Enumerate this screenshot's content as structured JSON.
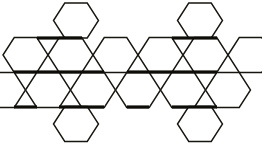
{
  "figure": {
    "background_color": "#ffffff",
    "stroke_color": "#17150f",
    "accent_stroke_color": "#0d0c08",
    "caption_fragment": "ons.",
    "width": 262,
    "height": 150
  },
  "chart_data": {
    "type": "diagram",
    "title": "",
    "subtitle": "",
    "xlabel": "",
    "ylabel": "",
    "grid": false,
    "legend": [],
    "annotations": [
      "ons."
    ],
    "geometry": {
      "hex_half_width": 22.5,
      "hex_point_inset": 11.25,
      "hex_half_height": 17.5,
      "column_pitch": 45,
      "row_pitch": 35,
      "thin_stroke_width": 1.4,
      "thick_stroke_width": 3.2
    },
    "rows": [
      {
        "index": 0,
        "center_y": 20.5,
        "centers_x": [
          76,
          200
        ],
        "count": 2
      },
      {
        "index": 1,
        "center_y": 55,
        "centers_x": [
          25.5,
          70.5,
          115.5,
          160.5,
          205.5,
          250.5
        ],
        "count": 6
      },
      {
        "index": 2,
        "center_y": 90,
        "centers_x": [
          3,
          48,
          93,
          138,
          183,
          228
        ],
        "count": 6
      },
      {
        "index": 3,
        "center_y": 124,
        "centers_x": [
          76,
          200
        ],
        "count": 2
      }
    ],
    "cells": [
      {
        "id": "r0c0",
        "cx": 76,
        "cy": 20.5,
        "row": 0,
        "col": 0
      },
      {
        "id": "r0c1",
        "cx": 200,
        "cy": 20.5,
        "row": 0,
        "col": 1
      },
      {
        "id": "r1c0",
        "cx": 25.5,
        "cy": 55,
        "row": 1,
        "col": 0
      },
      {
        "id": "r1c1",
        "cx": 70.5,
        "cy": 55,
        "row": 1,
        "col": 1
      },
      {
        "id": "r1c2",
        "cx": 115.5,
        "cy": 55,
        "row": 1,
        "col": 2
      },
      {
        "id": "r1c3",
        "cx": 160.5,
        "cy": 55,
        "row": 1,
        "col": 3
      },
      {
        "id": "r1c4",
        "cx": 205.5,
        "cy": 55,
        "row": 1,
        "col": 4
      },
      {
        "id": "r1c5",
        "cx": 250.5,
        "cy": 55,
        "row": 1,
        "col": 5
      },
      {
        "id": "r2c0",
        "cx": 3,
        "cy": 90,
        "row": 2,
        "col": 0
      },
      {
        "id": "r2c1",
        "cx": 48,
        "cy": 90,
        "row": 2,
        "col": 1
      },
      {
        "id": "r2c2",
        "cx": 93,
        "cy": 90,
        "row": 2,
        "col": 2
      },
      {
        "id": "r2c3",
        "cx": 138,
        "cy": 90,
        "row": 2,
        "col": 3
      },
      {
        "id": "r2c4",
        "cx": 183,
        "cy": 90,
        "row": 2,
        "col": 4
      },
      {
        "id": "r2c5",
        "cx": 228,
        "cy": 90,
        "row": 2,
        "col": 5
      },
      {
        "id": "r3c0",
        "cx": 76,
        "cy": 124,
        "row": 3,
        "col": 0
      },
      {
        "id": "r3c1",
        "cx": 200,
        "cy": 124,
        "row": 3,
        "col": 1
      }
    ],
    "thick_edges": [
      {
        "x1": 37,
        "y1": 38,
        "x2": 60,
        "y2": 38
      },
      {
        "x1": 60,
        "y1": 38,
        "x2": 82,
        "y2": 38
      },
      {
        "x1": 14,
        "y1": 72,
        "x2": 37,
        "y2": 72
      },
      {
        "x1": 37,
        "y1": 72,
        "x2": 59,
        "y2": 72
      },
      {
        "x1": 59,
        "y1": 72,
        "x2": 82,
        "y2": 72
      },
      {
        "x1": 82,
        "y1": 72,
        "x2": 104,
        "y2": 72
      },
      {
        "x1": 127,
        "y1": 72,
        "x2": 149,
        "y2": 72
      },
      {
        "x1": 149,
        "y1": 72,
        "x2": 172,
        "y2": 72
      },
      {
        "x1": 172,
        "y1": 72,
        "x2": 194,
        "y2": 72
      },
      {
        "x1": 194,
        "y1": 72,
        "x2": 217,
        "y2": 72
      },
      {
        "x1": 14,
        "y1": 107,
        "x2": 37,
        "y2": 107
      },
      {
        "x1": 59,
        "y1": 107,
        "x2": 82,
        "y2": 107
      },
      {
        "x1": 82,
        "y1": 107,
        "x2": 104,
        "y2": 107
      },
      {
        "x1": 127,
        "y1": 107,
        "x2": 149,
        "y2": 107
      },
      {
        "x1": 172,
        "y1": 107,
        "x2": 194,
        "y2": 107
      },
      {
        "x1": 194,
        "y1": 107,
        "x2": 217,
        "y2": 107
      },
      {
        "x1": 172,
        "y1": 38,
        "x2": 194,
        "y2": 38
      },
      {
        "x1": 194,
        "y1": 38,
        "x2": 217,
        "y2": 38
      }
    ]
  }
}
